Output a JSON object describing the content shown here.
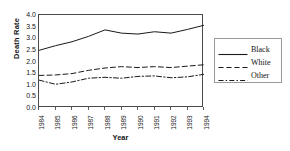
{
  "chart_data": {
    "type": "line",
    "title": "",
    "xlabel": "Year",
    "ylabel": "Death Rate",
    "x": [
      1984,
      1985,
      1986,
      1987,
      1988,
      1989,
      1990,
      1991,
      1992,
      1993,
      1994
    ],
    "xtick_labels": [
      "1984",
      "1985",
      "1986",
      "1987",
      "1988",
      "1989",
      "1990",
      "1991",
      "1992",
      "1993",
      "1994"
    ],
    "ytick_labels": [
      "4.0",
      "3.5",
      "3.0",
      "2.5",
      "2.0",
      "1.5",
      "1.0",
      "0.5",
      "0.0"
    ],
    "ytick_values": [
      4.0,
      3.5,
      3.0,
      2.5,
      2.0,
      1.5,
      1.0,
      0.5,
      0.0
    ],
    "ylim": [
      0.0,
      4.0
    ],
    "xlim": [
      1984,
      1994
    ],
    "grid": false,
    "legend_position": "right",
    "series": [
      {
        "name": "Black",
        "style": "solid",
        "color": "#1a1a1a",
        "values": [
          2.48,
          2.68,
          2.85,
          3.08,
          3.36,
          3.22,
          3.18,
          3.28,
          3.22,
          3.38,
          3.56
        ]
      },
      {
        "name": "White",
        "style": "dashed",
        "color": "#1a1a1a",
        "values": [
          1.4,
          1.42,
          1.48,
          1.62,
          1.72,
          1.78,
          1.74,
          1.78,
          1.74,
          1.8,
          1.86
        ]
      },
      {
        "name": "Other",
        "style": "dashdot",
        "color": "#1a1a1a",
        "values": [
          1.2,
          1.02,
          1.12,
          1.28,
          1.32,
          1.28,
          1.36,
          1.38,
          1.3,
          1.34,
          1.45
        ]
      }
    ]
  },
  "legend": {
    "entries": [
      {
        "label": "Black"
      },
      {
        "label": "White"
      },
      {
        "label": "Other"
      }
    ]
  }
}
